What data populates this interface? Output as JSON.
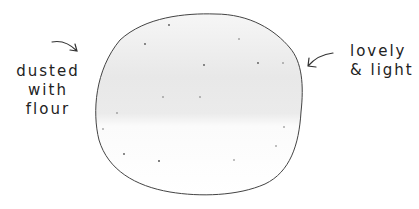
{
  "annotations": {
    "left": {
      "lines": [
        "dusted",
        "with",
        "flour"
      ]
    },
    "right": {
      "lines": [
        "lovely",
        "& light"
      ]
    }
  },
  "colors": {
    "ink": "#333333",
    "shade": "#e6e6e6",
    "background": "#ffffff"
  }
}
